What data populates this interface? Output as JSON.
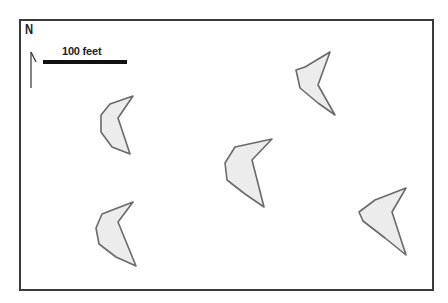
{
  "map": {
    "north_label": "N",
    "scale_label": "100 feet",
    "colors": {
      "frame": "#3a3a3a",
      "dune_fill": "#ececec",
      "dune_stroke": "#6a6a6a",
      "scale_bar": "#111111"
    },
    "dunes": [
      {
        "id": "dune-top-right",
        "points": "305,67 330,52 318,85 335,115 318,103 300,88 296,70"
      },
      {
        "id": "dune-left-upper",
        "points": "110,104 133,96 118,118 130,154 112,147 101,132 101,115"
      },
      {
        "id": "dune-center",
        "points": "235,147 272,139 252,160 264,207 245,194 227,180 225,163"
      },
      {
        "id": "dune-left-lower",
        "points": "102,214 133,202 118,222 136,266 116,257 99,244 96,228"
      },
      {
        "id": "dune-right-lower",
        "points": "375,200 406,188 392,212 406,255 385,238 363,221 359,212"
      }
    ]
  }
}
